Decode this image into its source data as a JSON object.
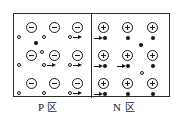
{
  "figure": {
    "type": "pn-junction-carrier-diagram",
    "background_color": "#ffffff",
    "line_color": "#2c2c2c",
    "glyph_color": "#1a1a1a"
  },
  "frame": {
    "x": 13,
    "y": 13,
    "width": 157,
    "height": 84,
    "divider_x": 90
  },
  "captions": {
    "p_region": "P ",
    "p_region_cjk": "区",
    "n_region": "N ",
    "n_region_cjk": "区"
  },
  "legend": {
    "acceptor_ion": "⊖",
    "donor_ion": "⊕",
    "hole": "hollow-small-circle",
    "electron": "filled-small-dot",
    "drift_arrow": "→"
  },
  "p_region": {
    "label": "P region",
    "ions": [
      {
        "x": 12,
        "y": 8
      },
      {
        "x": 35,
        "y": 8
      },
      {
        "x": 58,
        "y": 8
      },
      {
        "x": 12,
        "y": 36
      },
      {
        "x": 35,
        "y": 36
      },
      {
        "x": 58,
        "y": 36
      },
      {
        "x": 12,
        "y": 64
      },
      {
        "x": 35,
        "y": 64
      },
      {
        "x": 58,
        "y": 64
      }
    ],
    "holes": [
      {
        "x": 3,
        "y": 21,
        "arrow": false
      },
      {
        "x": 28,
        "y": 21,
        "arrow": false
      },
      {
        "x": 54,
        "y": 21,
        "arrow": true
      },
      {
        "x": 3,
        "y": 49,
        "arrow": false
      },
      {
        "x": 28,
        "y": 49,
        "arrow": true
      },
      {
        "x": 54,
        "y": 49,
        "arrow": true
      },
      {
        "x": 3,
        "y": 77,
        "arrow": false
      },
      {
        "x": 28,
        "y": 77,
        "arrow": false
      },
      {
        "x": 54,
        "y": 77,
        "arrow": true
      },
      {
        "x": 26,
        "y": 36,
        "arrow": false
      }
    ],
    "minority_electrons": [
      {
        "x": 20,
        "y": 27
      }
    ]
  },
  "n_region": {
    "label": "N region",
    "ions": [
      {
        "x": 6,
        "y": 8
      },
      {
        "x": 30,
        "y": 8
      },
      {
        "x": 55,
        "y": 8
      },
      {
        "x": 6,
        "y": 36
      },
      {
        "x": 30,
        "y": 36
      },
      {
        "x": 55,
        "y": 36
      },
      {
        "x": 6,
        "y": 64
      },
      {
        "x": 30,
        "y": 64
      },
      {
        "x": 55,
        "y": 64
      }
    ],
    "electrons": [
      {
        "x": 11,
        "y": 22,
        "arrow": true
      },
      {
        "x": 34,
        "y": 22,
        "arrow": false
      },
      {
        "x": 59,
        "y": 22,
        "arrow": false
      },
      {
        "x": 11,
        "y": 50,
        "arrow": true
      },
      {
        "x": 34,
        "y": 50,
        "arrow": true
      },
      {
        "x": 59,
        "y": 50,
        "arrow": false
      },
      {
        "x": 11,
        "y": 78,
        "arrow": true
      },
      {
        "x": 34,
        "y": 78,
        "arrow": false
      },
      {
        "x": 59,
        "y": 78,
        "arrow": false
      },
      {
        "x": 47,
        "y": 29,
        "arrow": false
      }
    ],
    "minority_holes": [
      {
        "x": 48,
        "y": 57
      }
    ]
  }
}
